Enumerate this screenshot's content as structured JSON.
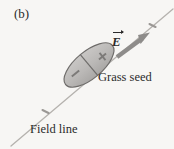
{
  "figure": {
    "panel_label": "(b)",
    "background_color": "#f7f6f4",
    "ink_color": "#2b2b2b"
  },
  "labels": {
    "grass_seed": "Grass seed",
    "field_line": "Field line",
    "e_field_symbol": "E"
  },
  "icons": {
    "positive_charge": "+",
    "negative_charge": "−"
  },
  "geometry": {
    "field_line": {
      "x1": 11,
      "y1": 146,
      "x2": 173,
      "y2": 9,
      "stroke": "#b3b0ac",
      "stroke_width": 1.2
    },
    "field_line_ticks": [
      {
        "cx": 45.5,
        "cy": 111.5
      },
      {
        "cx": 152.5,
        "cy": 25.5
      }
    ],
    "grass_seed": {
      "cx": 89,
      "cy": 65,
      "rx": 30,
      "ry": 13.5,
      "rotation_deg": -40,
      "fill": "#b9b7b5",
      "stroke": "#6a6866"
    },
    "charge_divider": {
      "note": "line across the seed perpendicular to its long axis"
    },
    "e_arrow": {
      "x1": 118,
      "y1": 56,
      "x2": 148,
      "y2": 34,
      "stroke": "#8d8b89",
      "stroke_width": 4.2
    }
  }
}
